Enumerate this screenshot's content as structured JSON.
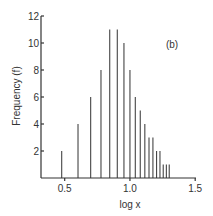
{
  "chart_data": {
    "type": "bar",
    "title": "",
    "panel_label": "(b)",
    "xlabel": "log x",
    "ylabel": "Frequency (f)",
    "xlim": [
      0.3,
      1.5
    ],
    "ylim": [
      0,
      12
    ],
    "x_ticks": [
      0.5,
      1.0,
      1.5
    ],
    "x_tick_labels": [
      "0.5",
      "1.0",
      "1.5"
    ],
    "y_ticks": [
      2,
      4,
      6,
      8,
      10,
      12
    ],
    "y_tick_labels": [
      "2",
      "4",
      "6",
      "8",
      "10",
      "12"
    ],
    "grid": false,
    "legend": null,
    "bar_style": "thin vertical lines",
    "x": [
      0.477,
      0.602,
      0.699,
      0.778,
      0.845,
      0.903,
      0.954,
      1.0,
      1.041,
      1.079,
      1.114,
      1.146,
      1.176,
      1.204,
      1.23,
      1.255,
      1.279,
      1.301
    ],
    "x_raw": [
      3,
      4,
      5,
      6,
      7,
      8,
      9,
      10,
      11,
      12,
      13,
      14,
      15,
      16,
      17,
      18,
      19,
      20
    ],
    "values": [
      2,
      4,
      6,
      8,
      11,
      11,
      10,
      8,
      6,
      5,
      4,
      3,
      3,
      2,
      2,
      1,
      1,
      1
    ]
  },
  "colors": {
    "axis": "#333333",
    "bar": "#444444",
    "text": "#333333",
    "background": "#ffffff"
  }
}
